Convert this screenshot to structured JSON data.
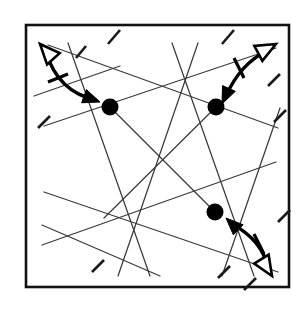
{
  "figure": {
    "type": "line-diagram",
    "canvas": {
      "width": 308,
      "height": 309,
      "background": "#ffffff"
    },
    "frame": {
      "label": "square-border",
      "x": 26,
      "y": 25,
      "width": 263,
      "height": 262,
      "stroke_color": "#111111",
      "stroke_width": 2.6,
      "fill": "#ffffff"
    },
    "style": {
      "line_color": "#3a3a3a",
      "line_width": 1.25,
      "dash_color": "#1a1a1a",
      "dash_width": 2.6,
      "dot_color": "#000000",
      "arrow_color": "#000000",
      "arrow_width": 3.4
    },
    "nodes": [
      {
        "id": "node-top-left",
        "label": "A",
        "cx": 110,
        "cy": 107,
        "r": 8.5
      },
      {
        "id": "node-top-right",
        "label": "B",
        "cx": 216,
        "cy": 107,
        "r": 8.5
      },
      {
        "id": "node-bottom-right",
        "label": "C",
        "cx": 215,
        "cy": 212,
        "r": 8.5
      }
    ],
    "lines": [
      {
        "id": "line-1",
        "x1": 44,
        "y1": 126,
        "x2": 276,
        "y2": 48
      },
      {
        "id": "line-2",
        "x1": 48,
        "y1": 45,
        "x2": 278,
        "y2": 128
      },
      {
        "id": "line-3",
        "x1": 42,
        "y1": 245,
        "x2": 276,
        "y2": 162
      },
      {
        "id": "line-4",
        "x1": 44,
        "y1": 192,
        "x2": 278,
        "y2": 272
      },
      {
        "id": "line-5",
        "x1": 68,
        "y1": 43,
        "x2": 150,
        "y2": 276
      },
      {
        "id": "line-6",
        "x1": 118,
        "y1": 276,
        "x2": 198,
        "y2": 43
      },
      {
        "id": "line-7",
        "x1": 172,
        "y1": 43,
        "x2": 254,
        "y2": 276
      },
      {
        "id": "line-8",
        "x1": 222,
        "y1": 276,
        "x2": 280,
        "y2": 108
      },
      {
        "id": "line-9",
        "x1": 110,
        "y1": 107,
        "x2": 215,
        "y2": 212
      },
      {
        "id": "line-10",
        "x1": 216,
        "y1": 107,
        "x2": 104,
        "y2": 218
      },
      {
        "id": "line-11",
        "x1": 42,
        "y1": 225,
        "x2": 160,
        "y2": 276
      },
      {
        "id": "line-12",
        "x1": 34,
        "y1": 96,
        "x2": 120,
        "y2": 66
      }
    ],
    "edge_dashes": [
      {
        "id": "dash-top-1",
        "x1": 108,
        "y1": 44,
        "x2": 120,
        "y2": 30
      },
      {
        "id": "dash-top-2",
        "x1": 222,
        "y1": 44,
        "x2": 234,
        "y2": 30
      },
      {
        "id": "dash-top-left",
        "x1": 76,
        "y1": 58,
        "x2": 86,
        "y2": 46
      },
      {
        "id": "dash-left-1",
        "x1": 38,
        "y1": 128,
        "x2": 50,
        "y2": 116
      },
      {
        "id": "dash-right-1",
        "x1": 268,
        "y1": 86,
        "x2": 280,
        "y2": 74
      },
      {
        "id": "dash-right-2",
        "x1": 274,
        "y1": 122,
        "x2": 286,
        "y2": 110
      },
      {
        "id": "dash-right-3",
        "x1": 278,
        "y1": 222,
        "x2": 290,
        "y2": 210
      },
      {
        "id": "dash-bottom-1",
        "x1": 92,
        "y1": 272,
        "x2": 104,
        "y2": 260
      },
      {
        "id": "dash-bottom-2",
        "x1": 218,
        "y1": 278,
        "x2": 230,
        "y2": 266
      },
      {
        "id": "dash-bottom-3",
        "x1": 244,
        "y1": 290,
        "x2": 256,
        "y2": 278
      }
    ],
    "arrows": [
      {
        "id": "arrow-top-left",
        "label": "double-headed-arrow-top-left",
        "description": "Curved double arrow: hollow head up-left, solid head down-right",
        "path": "M 46 52 Q 58 92 96 100",
        "head_hollow": {
          "tip_x": 40,
          "tip_y": 44,
          "angle_deg": 228
        },
        "head_solid": {
          "tip_x": 100,
          "tip_y": 102,
          "angle_deg": 20
        },
        "tick": {
          "x1": 48,
          "y1": 82,
          "x2": 68,
          "y2": 74
        }
      },
      {
        "id": "arrow-top-right",
        "label": "double-headed-arrow-top-right",
        "description": "Curved double arrow: hollow head up-right, solid head down-left",
        "path": "M 268 50 Q 240 64 226 96",
        "head_hollow": {
          "tip_x": 276,
          "tip_y": 44,
          "angle_deg": 332
        },
        "head_solid": {
          "tip_x": 222,
          "tip_y": 104,
          "angle_deg": 114
        },
        "tick": {
          "x1": 234,
          "y1": 58,
          "x2": 244,
          "y2": 78
        }
      },
      {
        "id": "arrow-bottom-right",
        "label": "double-headed-arrow-bottom-right",
        "description": "Curved double arrow: solid head up-left, hollow head down-right",
        "path": "M 232 224 Q 262 240 268 268",
        "head_solid": {
          "tip_x": 226,
          "tip_y": 218,
          "angle_deg": 224
        },
        "head_hollow": {
          "tip_x": 272,
          "tip_y": 276,
          "angle_deg": 58
        },
        "tick": {
          "x1": 254,
          "y1": 234,
          "x2": 264,
          "y2": 254
        }
      }
    ]
  }
}
